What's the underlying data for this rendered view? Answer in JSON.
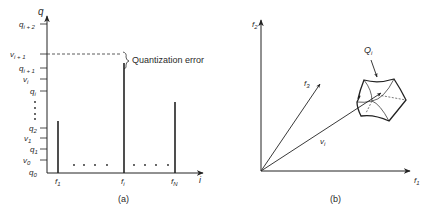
{
  "panel_a": {
    "caption": "(a)",
    "y_axis_label": "q",
    "x_axis_label": "i",
    "y_ticks": [
      {
        "base": "q",
        "sub": "i + 2",
        "y": 24
      },
      {
        "base": "v",
        "sub": "i + 1",
        "y": 54
      },
      {
        "base": "q",
        "sub": "i + 1",
        "y": 68
      },
      {
        "base": "v",
        "sub": "i",
        "y": 79
      },
      {
        "base": "q",
        "sub": "i",
        "y": 91
      },
      {
        "base": "q",
        "sub": "2",
        "y": 128
      },
      {
        "base": "v",
        "sub": "1",
        "y": 138
      },
      {
        "base": "q",
        "sub": "1",
        "y": 149
      },
      {
        "base": "v",
        "sub": "0",
        "y": 160
      },
      {
        "base": "q",
        "sub": "0",
        "y": 172
      }
    ],
    "bars": [
      {
        "label_base": "f",
        "label_sub": "1",
        "x": 58,
        "top": 121
      },
      {
        "label_base": "f",
        "label_sub": "i",
        "x": 124,
        "top": 63
      },
      {
        "label_base": "f",
        "label_sub": "N",
        "x": 175,
        "top": 102
      }
    ],
    "annotation": "Quantization error",
    "ellipsis": "· · · ·"
  },
  "panel_b": {
    "caption": "(b)",
    "axes": [
      {
        "base": "f",
        "sub": "1"
      },
      {
        "base": "f",
        "sub": "2"
      },
      {
        "base": "f",
        "sub": "3"
      }
    ],
    "vector_label": {
      "base": "v",
      "sub": "i"
    },
    "region_label": {
      "base": "Q",
      "sub": "i"
    }
  }
}
